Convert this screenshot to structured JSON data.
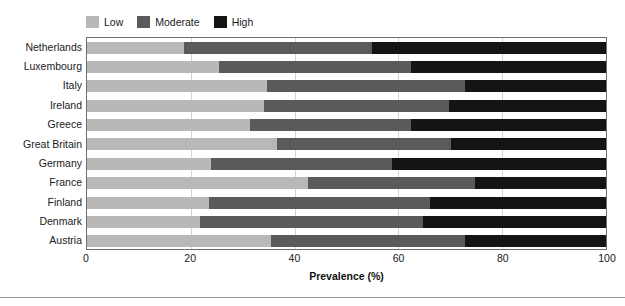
{
  "legend": {
    "position": "top-left",
    "entries": [
      {
        "label": "Low",
        "color": "#b8b8b8",
        "icon": "legend-swatch-low"
      },
      {
        "label": "Moderate",
        "color": "#5a5a5a",
        "icon": "legend-swatch-moderate"
      },
      {
        "label": "High",
        "color": "#141414",
        "icon": "legend-swatch-high"
      }
    ]
  },
  "axes": {
    "x_title": "Prevalence (%)",
    "x_ticks": [
      "0",
      "20",
      "40",
      "60",
      "80",
      "100"
    ],
    "x_tick_values": [
      0,
      20,
      40,
      60,
      80,
      100
    ],
    "y_title": ""
  },
  "chart_data": {
    "type": "bar",
    "orientation": "horizontal",
    "stacked": true,
    "stack_normalized": true,
    "title": "",
    "subtitle": "",
    "xlabel": "Prevalence (%)",
    "ylabel": "",
    "xlim": [
      0,
      100
    ],
    "xticks": [
      0,
      20,
      40,
      60,
      80,
      100
    ],
    "grid": true,
    "grid_axis": "x",
    "legend": [
      "Low",
      "Moderate",
      "High"
    ],
    "legend_position": "top-left",
    "categories": [
      "Netherlands",
      "Luxembourg",
      "Italy",
      "Ireland",
      "Greece",
      "Great Britain",
      "Germany",
      "France",
      "Finland",
      "Denmark",
      "Austria"
    ],
    "series": [
      {
        "name": "Low",
        "color": "#b8b8b8",
        "values": [
          18.7,
          25.5,
          34.7,
          34.1,
          31.5,
          36.7,
          23.8,
          42.5,
          23.5,
          21.8,
          35.4
        ]
      },
      {
        "name": "Moderate",
        "color": "#5a5a5a",
        "values": [
          36.2,
          37.0,
          38.2,
          35.6,
          30.9,
          33.4,
          34.9,
          32.2,
          42.5,
          42.9,
          37.5
        ]
      },
      {
        "name": "High",
        "color": "#141414",
        "values": [
          45.1,
          37.5,
          27.1,
          30.3,
          37.6,
          29.9,
          41.3,
          25.3,
          34.0,
          35.3,
          27.1
        ]
      }
    ],
    "cumulative_boundaries": {
      "low_end": [
        18.7,
        25.5,
        34.7,
        34.1,
        31.5,
        36.7,
        23.8,
        42.5,
        23.5,
        21.8,
        35.4
      ],
      "moderate_end": [
        54.9,
        62.5,
        72.9,
        69.7,
        62.4,
        70.1,
        58.7,
        74.7,
        66.0,
        64.7,
        72.9
      ]
    }
  }
}
